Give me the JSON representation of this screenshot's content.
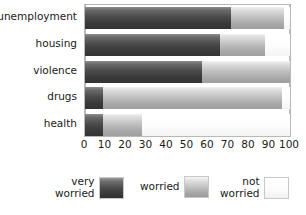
{
  "chart_data": {
    "type": "bar",
    "orientation": "horizontal",
    "stacked": true,
    "stack_mode": "percent",
    "title": "",
    "subtitle": "",
    "xlabel": "",
    "ylabel": "",
    "xlim": [
      0,
      100
    ],
    "xticks": [
      0,
      10,
      20,
      30,
      40,
      50,
      60,
      70,
      80,
      90,
      100
    ],
    "xtick_labels": [
      "0",
      "10",
      "20",
      "30",
      "40",
      "50",
      "60",
      "70",
      "80",
      "90",
      "100"
    ],
    "grid": true,
    "grid_axis": "x",
    "legend_position": "bottom",
    "categories": [
      "unemployment",
      "housing",
      "violence",
      "drugs",
      "health"
    ],
    "series": [
      {
        "name": "very worried",
        "legend_label_line1": "very",
        "legend_label_line2": "worried",
        "color": "#3b3b3b",
        "values": [
          71,
          66,
          57,
          9,
          9
        ]
      },
      {
        "name": "worried",
        "legend_label_line1": "worried",
        "legend_label_line2": "",
        "color": "#bdbdbd",
        "values": [
          26,
          22,
          43,
          87,
          19
        ]
      },
      {
        "name": "not worried",
        "legend_label_line1": "not",
        "legend_label_line2": "worried",
        "color": "#fafafa",
        "values": [
          3,
          12,
          0,
          4,
          72
        ]
      }
    ]
  }
}
